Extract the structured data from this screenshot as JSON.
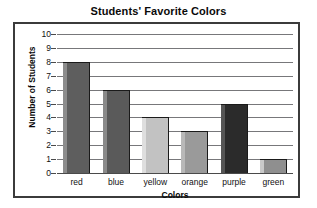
{
  "chart_data": {
    "type": "bar",
    "title": "Students' Favorite Colors",
    "xlabel": "Colors",
    "ylabel": "Number of Students",
    "categories": [
      "red",
      "blue",
      "yellow",
      "orange",
      "purple",
      "green"
    ],
    "values": [
      8,
      6,
      4,
      3,
      5,
      1
    ],
    "ylim": [
      0,
      10
    ],
    "ytick_labels": [
      "10",
      "9",
      "8",
      "7",
      "6",
      "5",
      "4",
      "3",
      "2",
      "1",
      "0"
    ],
    "ytick_values": [
      10,
      9,
      8,
      7,
      6,
      5,
      4,
      3,
      2,
      1,
      0
    ],
    "grid": true,
    "legend": false,
    "bar_colors": [
      "#5e5e5e",
      "#5a5a5a",
      "#c2c2c2",
      "#9a9a9a",
      "#2b2b2b",
      "#8f8f8f"
    ],
    "bar_bevel_colors": [
      "#8c8c8c",
      "#8a8a8a",
      "#dedede",
      "#b8b8b8",
      "#555555",
      "#c9c9c9"
    ]
  },
  "frame": {
    "border_color": "#3b3b3b",
    "gridline_color": "#77777a",
    "axis_color": "#4a4a4a",
    "background": "#ffffff"
  }
}
